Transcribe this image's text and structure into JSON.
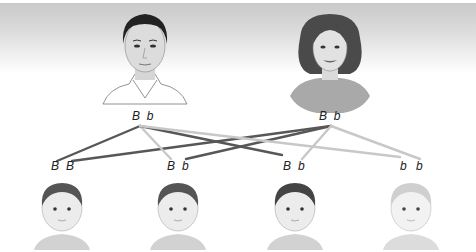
{
  "diagram": {
    "title": "",
    "colors": {
      "dominant_line": "#555555",
      "recessive_line": "#c4c4c4",
      "background_top": "#c9c9c9"
    },
    "parents": [
      {
        "id": "father",
        "label": "father",
        "alleles": [
          "B",
          "b"
        ],
        "allele_text": "B  b"
      },
      {
        "id": "mother",
        "label": "mother",
        "alleles": [
          "B",
          "b"
        ],
        "allele_text": "B  b"
      }
    ],
    "offspring": [
      {
        "id": "child-1",
        "alleles": [
          "B",
          "B"
        ],
        "a1": "B",
        "a2": "B",
        "hair": "dark"
      },
      {
        "id": "child-2",
        "alleles": [
          "B",
          "b"
        ],
        "a1": "B",
        "a2": "b",
        "hair": "dark"
      },
      {
        "id": "child-3",
        "alleles": [
          "B",
          "b"
        ],
        "a1": "B",
        "a2": "b",
        "hair": "dark"
      },
      {
        "id": "child-4",
        "alleles": [
          "b",
          "b"
        ],
        "a1": "b",
        "a2": "b",
        "hair": "light"
      }
    ],
    "connections": [
      {
        "from": "father",
        "allele": "B",
        "to": "child-1",
        "style": "dark"
      },
      {
        "from": "mother",
        "allele": "B",
        "to": "child-1",
        "style": "dark"
      },
      {
        "from": "father",
        "allele": "b",
        "to": "child-2",
        "style": "light"
      },
      {
        "from": "mother",
        "allele": "B",
        "to": "child-2",
        "style": "dark"
      },
      {
        "from": "father",
        "allele": "B",
        "to": "child-3",
        "style": "dark"
      },
      {
        "from": "mother",
        "allele": "b",
        "to": "child-3",
        "style": "light"
      },
      {
        "from": "father",
        "allele": "b",
        "to": "child-4",
        "style": "light"
      },
      {
        "from": "mother",
        "allele": "b",
        "to": "child-4",
        "style": "light"
      }
    ]
  }
}
